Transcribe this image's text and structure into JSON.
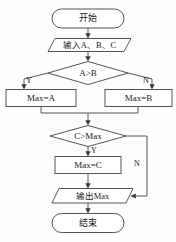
{
  "diagram": {
    "orientation": "top-to-bottom",
    "colors": {
      "stroke": "#555555",
      "text": "#1a1a1a",
      "background": "#fdfdfd",
      "arrow": "#3a3a3a"
    },
    "nodes": {
      "start": {
        "label": "开始",
        "shape": "terminator"
      },
      "input": {
        "label": "输入A、B、C",
        "shape": "parallelogram"
      },
      "decision_ab": {
        "label": "A>B",
        "shape": "diamond"
      },
      "max_a": {
        "label": "Max=A",
        "shape": "rectangle"
      },
      "max_b": {
        "label": "Max=B",
        "shape": "rectangle"
      },
      "decision_cmax": {
        "label": "C>Max",
        "shape": "diamond"
      },
      "max_c": {
        "label": "Max=C",
        "shape": "rectangle"
      },
      "output": {
        "label": "输出Max",
        "shape": "parallelogram"
      },
      "end": {
        "label": "结束",
        "shape": "terminator"
      }
    },
    "branches": {
      "ab_yes": "Y",
      "ab_no": "N",
      "cmax_yes": "Y",
      "cmax_no": "N"
    }
  }
}
